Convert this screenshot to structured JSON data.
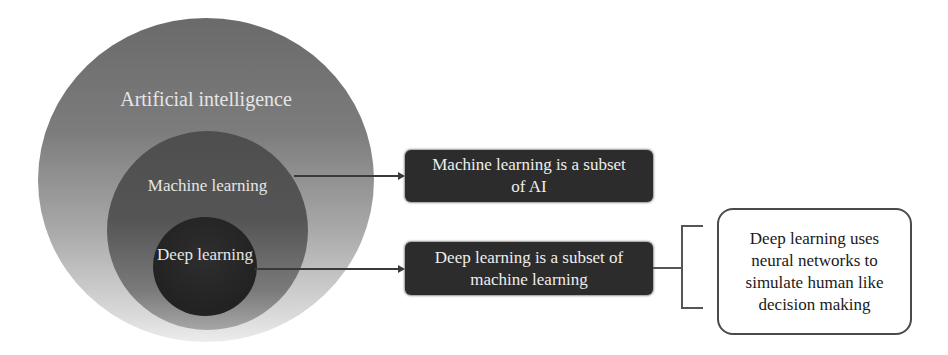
{
  "diagram": {
    "type": "nested-venn",
    "circles": [
      {
        "id": "ai",
        "label": "Artificial intelligence"
      },
      {
        "id": "ml",
        "label": "Machine learning"
      },
      {
        "id": "dl",
        "label": "Deep learning"
      }
    ],
    "callouts": [
      {
        "from": "ml",
        "text": "Machine learning is a subset of AI"
      },
      {
        "from": "dl",
        "text": "Deep learning is a subset of machine learning"
      }
    ],
    "note": {
      "attached_to": "callout-dl",
      "text": "Deep learning uses neural networks to simulate human like decision making"
    },
    "colors": {
      "outer_circle_top": "#6a6a6a",
      "outer_circle_bottom": "#ececec",
      "middle_circle": "#555555",
      "inner_circle": "#242424",
      "callout_box": "#2c2c2c",
      "callout_text": "#eeeeee",
      "connector": "#3a3a3a"
    }
  }
}
